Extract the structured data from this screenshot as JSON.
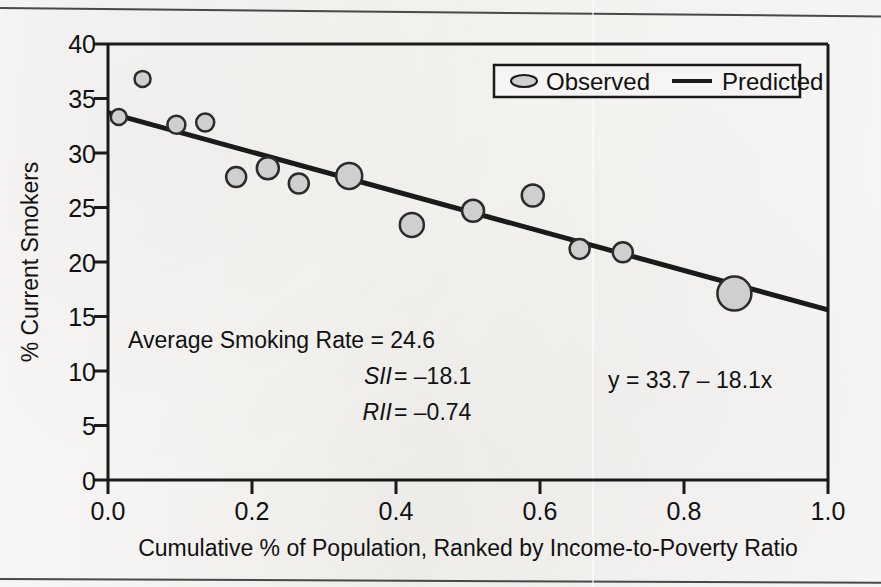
{
  "chart_data": {
    "type": "scatter",
    "title": "",
    "xlabel": "Cumulative % of Population, Ranked by Income-to-Poverty Ratio",
    "ylabel": "% Current Smokers",
    "xlim": [
      0.0,
      1.0
    ],
    "ylim": [
      0,
      40
    ],
    "xticks": [
      "0.0",
      "0.2",
      "0.4",
      "0.6",
      "0.8",
      "1.0"
    ],
    "xtick_values": [
      0.0,
      0.2,
      0.4,
      0.6,
      0.8,
      1.0
    ],
    "yticks": [
      "0",
      "5",
      "10",
      "15",
      "20",
      "25",
      "30",
      "35",
      "40"
    ],
    "ytick_values": [
      0,
      5,
      10,
      15,
      20,
      25,
      30,
      35,
      40
    ],
    "grid": false,
    "legend_position": "top-right",
    "series": [
      {
        "name": "Observed",
        "type": "scatter",
        "marker": "circle",
        "fill": "#cfcfcf",
        "stroke": "#2b2b2b",
        "points": [
          {
            "x": 0.015,
            "y": 33.3,
            "r": 8
          },
          {
            "x": 0.048,
            "y": 36.8,
            "r": 8
          },
          {
            "x": 0.095,
            "y": 32.6,
            "r": 9
          },
          {
            "x": 0.135,
            "y": 32.8,
            "r": 9
          },
          {
            "x": 0.178,
            "y": 27.8,
            "r": 10
          },
          {
            "x": 0.222,
            "y": 28.6,
            "r": 11
          },
          {
            "x": 0.265,
            "y": 27.2,
            "r": 10
          },
          {
            "x": 0.335,
            "y": 27.9,
            "r": 13
          },
          {
            "x": 0.422,
            "y": 23.4,
            "r": 12
          },
          {
            "x": 0.507,
            "y": 24.7,
            "r": 11
          },
          {
            "x": 0.59,
            "y": 26.1,
            "r": 11
          },
          {
            "x": 0.655,
            "y": 21.2,
            "r": 10
          },
          {
            "x": 0.715,
            "y": 20.9,
            "r": 10
          },
          {
            "x": 0.87,
            "y": 17.1,
            "r": 17
          }
        ]
      },
      {
        "name": "Predicted",
        "type": "line",
        "stroke": "#1a1a1a",
        "intercept": 33.7,
        "slope": -18.1,
        "endpoints": [
          {
            "x": 0.0,
            "y": 33.7
          },
          {
            "x": 1.0,
            "y": 15.6
          }
        ]
      }
    ],
    "annotations": [
      {
        "id": "average-smoking-rate",
        "text": "Average Smoking Rate =  24.6",
        "italic": false
      },
      {
        "id": "sii",
        "text_italic": "SII",
        "text_rest": " = –18.1",
        "italic": true
      },
      {
        "id": "rii",
        "text_italic": "RII",
        "text_rest": " = –0.74",
        "italic": true
      },
      {
        "id": "equation",
        "text": "y = 33.7 – 18.1x",
        "italic": false
      }
    ]
  },
  "legend": {
    "observed_label": "Observed",
    "predicted_label": "Predicted"
  },
  "axes": {
    "y_title": "% Current Smokers",
    "x_title": "Cumulative % of Population, Ranked by Income-to-Poverty Ratio",
    "y_tick_0": "0",
    "y_tick_5": "5",
    "y_tick_10": "10",
    "y_tick_15": "15",
    "y_tick_20": "20",
    "y_tick_25": "25",
    "y_tick_30": "30",
    "y_tick_35": "35",
    "y_tick_40": "40",
    "x_tick_0": "0.0",
    "x_tick_1": "0.2",
    "x_tick_2": "0.4",
    "x_tick_3": "0.6",
    "x_tick_4": "0.8",
    "x_tick_5": "1.0"
  },
  "annotations": {
    "avg_rate": "Average Smoking Rate =  24.6",
    "sii_name": "SII",
    "sii_value": " = –18.1",
    "rii_name": "RII",
    "rii_value": " = –0.74",
    "equation": "y = 33.7 – 18.1x"
  },
  "colors": {
    "marker_fill": "#cfcfcf",
    "marker_stroke": "#2b2b2b",
    "line": "#1a1a1a",
    "axis": "#1a1a1a",
    "page_background": "#f4f3f1",
    "text": "#111111"
  }
}
